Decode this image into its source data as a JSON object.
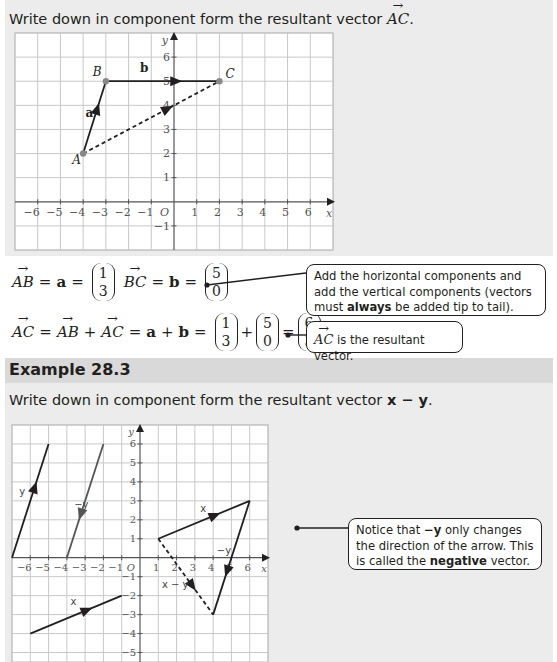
{
  "section1": {
    "prompt_prefix": "Write down in component form the resultant vector ",
    "prompt_vector": "AC",
    "prompt_suffix": ".",
    "chart": {
      "x_ticks": [
        "−6",
        "−5",
        "−4",
        "−3",
        "−2",
        "−1",
        "1",
        "2",
        "3",
        "4",
        "5",
        "6"
      ],
      "y_ticks": [
        "1",
        "2",
        "3",
        "4",
        "5",
        "6",
        "−1"
      ],
      "x_label": "x",
      "y_label": "y",
      "origin_label": "O",
      "points": {
        "A": "A",
        "B": "B",
        "C": "C"
      },
      "vector_labels": {
        "a": "a",
        "b": "b"
      }
    },
    "equation1": {
      "AB": "AB",
      "eq": "=",
      "a": "a",
      "a_col": [
        "1",
        "3"
      ],
      "BC": "BC",
      "b": "b",
      "b_col": [
        "5",
        "0"
      ]
    },
    "equation2": {
      "AC": "AC",
      "AB": "AB",
      "AC2": "AC",
      "plus": "+",
      "a": "a",
      "b": "b",
      "col1": [
        "1",
        "3"
      ],
      "col2": [
        "5",
        "0"
      ],
      "result": [
        "6",
        "3"
      ]
    },
    "callout1": {
      "text_before": "Add the horizontal components and add the vertical components (vectors must ",
      "bold": "always",
      "text_after": " be added tip to tail)."
    },
    "callout2": {
      "vector": "AC",
      "text": " is the resultant vector."
    }
  },
  "example": {
    "title": "Example 28.3",
    "prompt_prefix": "Write down in component form the resultant vector ",
    "prompt_expr": "x − y",
    "prompt_suffix": ".",
    "chart": {
      "x_ticks": [
        "−6",
        "−5",
        "−4",
        "−3",
        "−2",
        "−1",
        "1",
        "2",
        "3",
        "4",
        "5",
        "6"
      ],
      "y_ticks": [
        "6",
        "5",
        "4",
        "3",
        "2",
        "1",
        "−1",
        "−2",
        "−3",
        "−4",
        "−5"
      ],
      "x_label": "x",
      "y_label": "y",
      "origin_label": "O",
      "vector_labels": {
        "y": "y",
        "neg_y": "−y",
        "x": "x",
        "x_minus_y": "x − y"
      }
    },
    "callout": {
      "text_before": "Notice that ",
      "bold1": "−y",
      "text_mid": " only changes the direction of the arrow. This is called the ",
      "bold2": "negative",
      "text_after": " vector."
    }
  },
  "chart_data": [
    {
      "type": "vector-diagram",
      "title": "Resultant vector AC",
      "xlabel": "x",
      "ylabel": "y",
      "xlim": [
        -7,
        7
      ],
      "ylim": [
        -2,
        7
      ],
      "grid": true,
      "points": {
        "A": [
          -4,
          2
        ],
        "B": [
          -3,
          5
        ],
        "C": [
          2,
          5
        ]
      },
      "vectors": [
        {
          "name": "a",
          "from": [
            -4,
            2
          ],
          "to": [
            -3,
            5
          ],
          "style": "solid"
        },
        {
          "name": "b",
          "from": [
            -3,
            5
          ],
          "to": [
            2,
            5
          ],
          "style": "solid"
        },
        {
          "name": "AC",
          "from": [
            -4,
            2
          ],
          "to": [
            2,
            5
          ],
          "style": "dashed"
        }
      ]
    },
    {
      "type": "vector-diagram",
      "title": "Example 28.3: x − y",
      "xlabel": "x",
      "ylabel": "y",
      "xlim": [
        -7,
        7
      ],
      "ylim": [
        -5.5,
        7
      ],
      "grid": true,
      "vectors": [
        {
          "name": "y",
          "from": [
            -7,
            0
          ],
          "to": [
            -5,
            6
          ],
          "style": "solid"
        },
        {
          "name": "−y",
          "from": [
            -2,
            6
          ],
          "to": [
            -4,
            0
          ],
          "style": "solid",
          "color": "#555555"
        },
        {
          "name": "x",
          "from": [
            -6,
            -4
          ],
          "to": [
            -1,
            -2
          ],
          "style": "solid"
        },
        {
          "name": "x",
          "from": [
            1,
            1
          ],
          "to": [
            6,
            3
          ],
          "style": "solid"
        },
        {
          "name": "−y",
          "from": [
            6,
            3
          ],
          "to": [
            4,
            -3
          ],
          "style": "solid"
        },
        {
          "name": "x − y",
          "from": [
            1,
            1
          ],
          "to": [
            4,
            -3
          ],
          "style": "dashed"
        }
      ]
    }
  ]
}
